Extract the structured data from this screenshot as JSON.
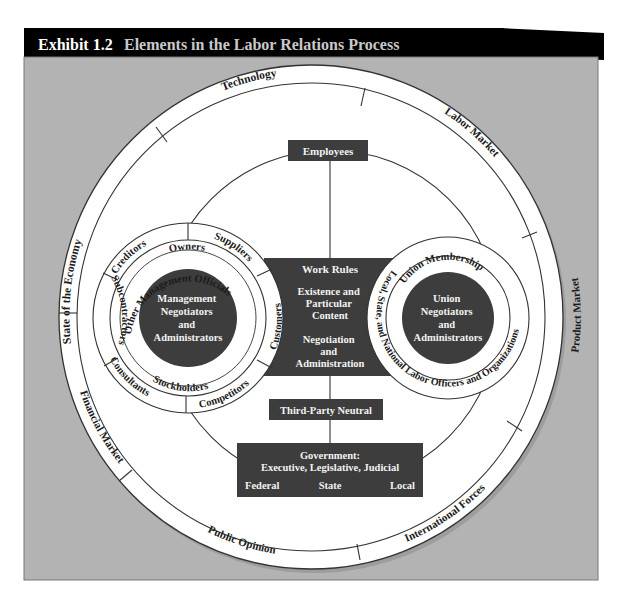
{
  "header": {
    "exhibit_number": "Exhibit 1.2",
    "title": "Elements in the Labor Relations Process",
    "background_color": "#000000",
    "number_color": "#ffffff",
    "title_color": "#c9c9c9"
  },
  "colors": {
    "frame_background": "#b3b3b3",
    "circle_fill": "#ffffff",
    "line": "#333333",
    "dark_box": "#3d3d3d",
    "box_text": "#f2f2f2",
    "ring_text": "#1a1a1a"
  },
  "outer_ring": {
    "segments": [
      {
        "label": "Technology"
      },
      {
        "label": "Labor Market"
      },
      {
        "label": "Product Market"
      },
      {
        "label": "International Forces"
      },
      {
        "label": "Public Opinion"
      },
      {
        "label": "Financial Market"
      },
      {
        "label": "State of the Economy"
      }
    ]
  },
  "management": {
    "core_label_lines": [
      "Management",
      "Negotiators",
      "and",
      "Administrators"
    ],
    "inner_ring_label": "Other Management Officials",
    "middle_ring": {
      "top_label": "Owners",
      "bottom_label": "Stockholders"
    },
    "outer_ring_segments": [
      {
        "label": "Creditors"
      },
      {
        "label": "Suppliers"
      },
      {
        "label": "Customers"
      },
      {
        "label": "Competitors"
      },
      {
        "label": "Consultants"
      },
      {
        "label": "Subcontractors"
      }
    ]
  },
  "union": {
    "core_label_lines": [
      "Union",
      "Negotiators",
      "and",
      "Administrators"
    ],
    "inner_ring_label": "Union Membership",
    "outer_ring_label": "Local, State, and National Labor Officers and Organizations"
  },
  "center": {
    "employees_label": "Employees",
    "work_rules": {
      "title": "Work Rules",
      "content_lines": [
        "Existence and",
        "Particular",
        "Content"
      ],
      "process_lines": [
        "Negotiation",
        "and",
        "Administration"
      ]
    },
    "third_party_label": "Third-Party Neutral",
    "government": {
      "title": "Government:",
      "branches": "Executive, Legislative, Judicial",
      "levels": [
        "Federal",
        "State",
        "Local"
      ]
    }
  }
}
